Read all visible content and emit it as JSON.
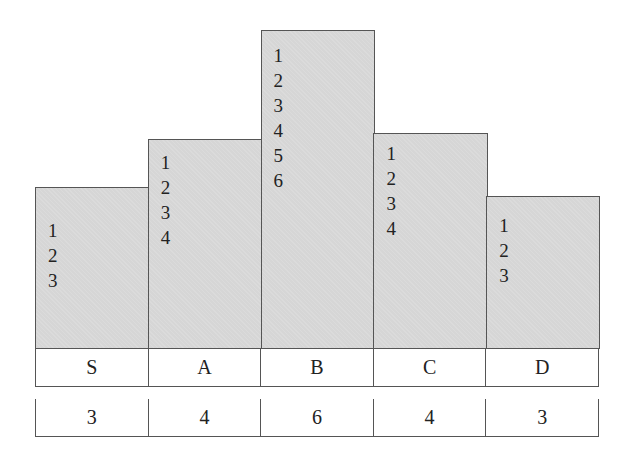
{
  "chart_data": {
    "type": "bar",
    "categories": [
      "S",
      "A",
      "B",
      "C",
      "D"
    ],
    "values": [
      3,
      4,
      6,
      4,
      3
    ],
    "stack_labels": [
      [
        "1",
        "2",
        "3"
      ],
      [
        "1",
        "2",
        "3",
        "4"
      ],
      [
        "1",
        "2",
        "3",
        "4",
        "5",
        "6"
      ],
      [
        "1",
        "2",
        "3",
        "4"
      ],
      [
        "1",
        "2",
        "3"
      ]
    ],
    "title": "",
    "xlabel": "",
    "ylabel": ""
  },
  "labels": [
    "S",
    "A",
    "B",
    "C",
    "D"
  ],
  "counts": [
    "3",
    "4",
    "6",
    "4",
    "3"
  ],
  "colors": {
    "bar_fill": "#d6d6d6",
    "border": "#555555"
  }
}
